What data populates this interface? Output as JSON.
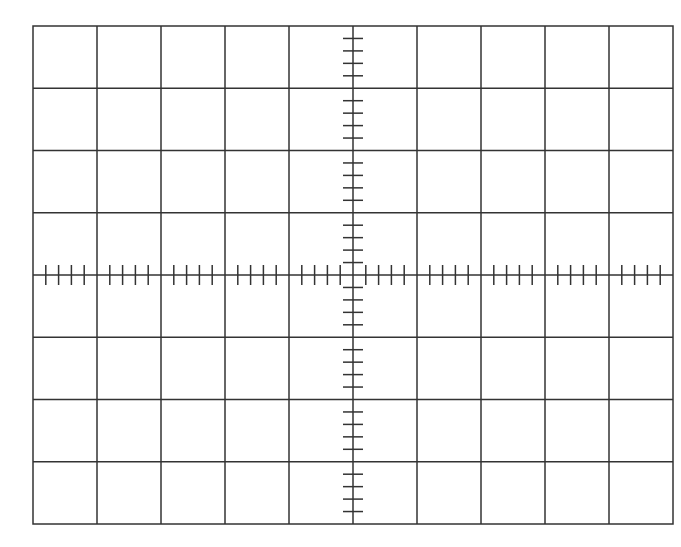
{
  "graticule": {
    "left": 33,
    "top": 26,
    "width": 640,
    "height": 498,
    "divisions_x": 10,
    "divisions_y": 8,
    "subdivisions_per_division": 5,
    "tick_half_length": 10,
    "colors": {
      "background": "#ffffff",
      "line": "#333333"
    },
    "line_width": 1.5,
    "center_axes": true
  }
}
